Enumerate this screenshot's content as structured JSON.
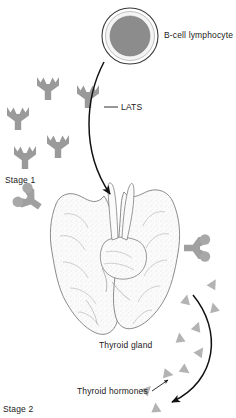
{
  "figure": {
    "width": 236,
    "height": 418,
    "background": "#ffffff"
  },
  "colors": {
    "antibody_fill": "#9a9a9a",
    "antibody_bound_fill": "#a0a0a0",
    "receptor_knob_fill": "#a5a5a5",
    "cell_nucleus_fill": "#8c8c8c",
    "cell_ring_fill": "#f2f2f2",
    "cell_outline": "#3a3a3a",
    "hormone_triangle_fill": "#b3b3b3",
    "arrow_stroke": "#111111",
    "leader_stroke": "#1a1a1a",
    "gland_outline": "#6e6e6e",
    "gland_fill": "#fbfbfb",
    "gland_stipple": "#c8c8c8",
    "text": "#1a1a1a"
  },
  "labels": {
    "b_cell": "B-cell lymphocyte",
    "lats": "LATS",
    "stage_1": "Stage 1",
    "thyroid_gland": "Thyroid gland",
    "thyroid_hormones": "Thyroid hormones",
    "stage_2": "Stage 2"
  },
  "label_positions": {
    "b_cell": {
      "x": 164,
      "y": 32
    },
    "lats": {
      "x": 120,
      "y": 110
    },
    "stage_1": {
      "x": 6,
      "y": 180
    },
    "thyroid_gland": {
      "x": 100,
      "y": 345
    },
    "thyroid_hormones": {
      "x": 78,
      "y": 392
    },
    "stage_2": {
      "x": 4,
      "y": 408
    }
  },
  "b_cell": {
    "name": "B-cell lymphocyte",
    "center_x": 130,
    "center_y": 36,
    "outer_radius": 28,
    "ring_radius": 25,
    "nucleus_radius": 20
  },
  "antibodies_free": [
    {
      "id": "lats-1",
      "x": 48,
      "y": 88,
      "rotation": 0,
      "scale": 1.0
    },
    {
      "id": "lats-2",
      "x": 88,
      "y": 96,
      "rotation": 0,
      "scale": 1.0
    },
    {
      "id": "lats-3",
      "x": 18,
      "y": 118,
      "rotation": 0,
      "scale": 1.0
    },
    {
      "id": "lats-4",
      "x": 58,
      "y": 146,
      "rotation": 0,
      "scale": 1.0
    },
    {
      "id": "lats-5",
      "x": 25,
      "y": 157,
      "rotation": 0,
      "scale": 1.0
    }
  ],
  "antibodies_bound": [
    {
      "id": "bound-left",
      "x": 30,
      "y": 200,
      "rotation": -55,
      "scale": 1.0
    },
    {
      "id": "bound-right",
      "x": 196,
      "y": 248,
      "rotation": 90,
      "scale": 1.0
    }
  ],
  "hormone_triangles": [
    {
      "id": "t1",
      "x": 186,
      "y": 300,
      "rotation": 12
    },
    {
      "id": "t2",
      "x": 214,
      "y": 308,
      "rotation": -14
    },
    {
      "id": "t3",
      "x": 197,
      "y": 327,
      "rotation": 20
    },
    {
      "id": "t4",
      "x": 180,
      "y": 338,
      "rotation": -8
    },
    {
      "id": "t5",
      "x": 200,
      "y": 352,
      "rotation": 35
    },
    {
      "id": "t6",
      "x": 185,
      "y": 370,
      "rotation": 125
    },
    {
      "id": "t7",
      "x": 168,
      "y": 374,
      "rotation": 100
    },
    {
      "id": "t8",
      "x": 147,
      "y": 390,
      "rotation": 45
    },
    {
      "id": "t9",
      "x": 156,
      "y": 408,
      "rotation": -5
    },
    {
      "id": "t10",
      "x": 213,
      "y": 284,
      "rotation": 30
    }
  ],
  "arrows": [
    {
      "id": "bcell-to-gland",
      "name": "lats-secretion-arrow",
      "path": "M 104,62 C 86,96 80,150 110,194",
      "head_at": {
        "x": 113,
        "y": 200
      }
    },
    {
      "id": "hormone-flow",
      "name": "hormone-release-arrow",
      "path": "M 193,295 C 222,330 218,380 172,402",
      "head_at": {
        "x": 166,
        "y": 404
      }
    }
  ],
  "leaders": [
    {
      "id": "lats-leader",
      "name": "lats-leader-line",
      "x1": 104,
      "y1": 107,
      "x2": 118,
      "y2": 107
    },
    {
      "id": "hormone-leader",
      "name": "hormone-leader-line",
      "x1": 152,
      "y1": 390,
      "x2": 168,
      "y2": 381
    }
  ],
  "thyroid_gland": {
    "name": "thyroid gland anatomical illustration",
    "bounds": {
      "x": 48,
      "y": 186,
      "width": 150,
      "height": 150
    }
  }
}
